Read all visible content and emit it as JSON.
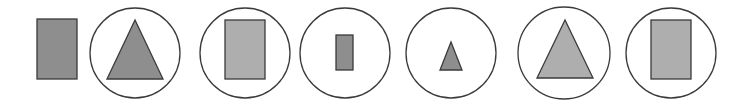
{
  "colors": {
    "background": "#ffffff",
    "stroke": "#3a3a3a",
    "fill_dark": "#8e8e8e",
    "fill_light": "#aeaeae"
  },
  "sequence": [
    {
      "index": 0,
      "enclosed": false,
      "circle": null,
      "shape": {
        "type": "rectangle",
        "size": "large",
        "shade": "dark",
        "x": 37,
        "y": 19,
        "w": 40,
        "h": 60
      }
    },
    {
      "index": 1,
      "enclosed": true,
      "circle": {
        "cx": 135,
        "cy": 53,
        "r": 45
      },
      "shape": {
        "type": "triangle",
        "size": "large",
        "shade": "dark",
        "points": [
          [
            135,
            20
          ],
          [
            107,
            79
          ],
          [
            163,
            79
          ]
        ]
      }
    },
    {
      "index": 2,
      "enclosed": true,
      "circle": {
        "cx": 245,
        "cy": 53,
        "r": 45
      },
      "shape": {
        "type": "rectangle",
        "size": "large",
        "shade": "light",
        "x": 225,
        "y": 20,
        "w": 40,
        "h": 59
      }
    },
    {
      "index": 3,
      "enclosed": true,
      "circle": {
        "cx": 345,
        "cy": 53,
        "r": 45
      },
      "shape": {
        "type": "rectangle",
        "size": "small",
        "shade": "dark",
        "x": 336,
        "y": 35,
        "w": 17,
        "h": 35
      }
    },
    {
      "index": 4,
      "enclosed": true,
      "circle": {
        "cx": 451,
        "cy": 53,
        "r": 45
      },
      "shape": {
        "type": "triangle",
        "size": "small",
        "shade": "dark",
        "points": [
          [
            451,
            42
          ],
          [
            440,
            70
          ],
          [
            462,
            70
          ]
        ]
      }
    },
    {
      "index": 5,
      "enclosed": true,
      "circle": {
        "cx": 564,
        "cy": 53,
        "r": 46
      },
      "shape": {
        "type": "triangle",
        "size": "large",
        "shade": "light",
        "points": [
          [
            565,
            20
          ],
          [
            537,
            78
          ],
          [
            593,
            78
          ]
        ]
      }
    },
    {
      "index": 6,
      "enclosed": true,
      "circle": {
        "cx": 671,
        "cy": 53,
        "r": 45
      },
      "shape": {
        "type": "rectangle",
        "size": "large",
        "shade": "light",
        "x": 651,
        "y": 20,
        "w": 40,
        "h": 59
      }
    }
  ]
}
